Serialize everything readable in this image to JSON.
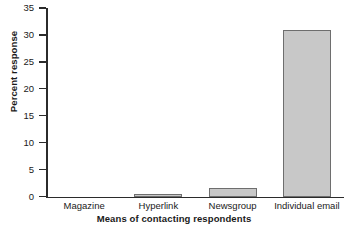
{
  "chart_data": {
    "type": "bar",
    "title": "",
    "xlabel": "Means of contacting respondents",
    "ylabel": "Percent response",
    "categories": [
      "Magazine",
      "Hyperlink",
      "Newsgroup",
      "Individual email"
    ],
    "values": [
      0,
      0.5,
      1.6,
      31
    ],
    "ylim": [
      0,
      35
    ],
    "yticks": [
      0,
      5,
      10,
      15,
      20,
      25,
      30,
      35
    ],
    "ytick_labels": [
      "0",
      "5",
      "10",
      "15",
      "20",
      "25",
      "30",
      "35"
    ],
    "grid": false,
    "legend": null,
    "colors": {
      "bar_fill": "#c8c8c8",
      "bar_border": "#6e6e6e",
      "axis": "#2b2b2b",
      "text": "#1a1a1a",
      "background": "#ffffff"
    }
  }
}
